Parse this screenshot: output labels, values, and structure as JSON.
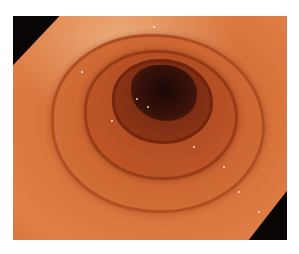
{
  "image": {
    "subject": "Endoscopic view of colon lumen with haustral folds",
    "colors": {
      "background": "#ffffff",
      "mucosa": "#d8733c",
      "mucosa_highlight": "#f0b080",
      "lumen_dark": "#1a0806",
      "corner_shadow": "#0a0505"
    }
  }
}
